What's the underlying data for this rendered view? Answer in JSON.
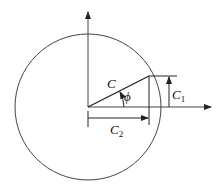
{
  "diagram": {
    "type": "phasor-circle",
    "labels": {
      "magnitude": "C",
      "angle": "ϕ",
      "vertical_component": "C",
      "vertical_component_sub": "1",
      "horizontal_component": "C",
      "horizontal_component_sub": "2"
    },
    "colors": {
      "stroke": "#333333",
      "text": "#111111",
      "background": "#ffffff"
    }
  }
}
